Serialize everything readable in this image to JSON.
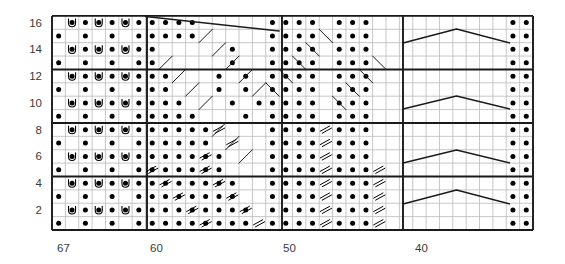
{
  "chart_data": {
    "type": "table",
    "title": "",
    "subtitle": "",
    "xlabel": "",
    "ylabel": "",
    "grid": true,
    "legend": "none",
    "rows": 16,
    "columns": 36,
    "row_labels": [
      "2",
      "4",
      "6",
      "8",
      "10",
      "12",
      "14",
      "16"
    ],
    "row_label_rows": [
      2,
      4,
      6,
      8,
      10,
      12,
      14,
      16
    ],
    "column_labels": [
      "67",
      "60",
      "50",
      "40"
    ],
    "column_label_positions": [
      0,
      7,
      17,
      27
    ],
    "column_label_x": [
      57,
      150,
      283,
      415
    ],
    "symbols": {
      "purl-dot": "•",
      "yarn-over-u": "U",
      "decrease-slant": "//",
      "cable-line": "line",
      "blank": ""
    },
    "geometry": {
      "grid_left": 52,
      "grid_top": 16,
      "grid_right": 533,
      "grid_bottom": 230,
      "cell_width": 13.36,
      "cell_height": 13.38,
      "heavy_vertical_x": [
        52,
        147,
        282,
        403,
        533
      ],
      "heavy_horizontal_rows": [
        0,
        4,
        8,
        12,
        16
      ]
    },
    "cells": {
      "dots": [
        [
          1,
          0
        ],
        [
          1,
          2
        ],
        [
          1,
          4
        ],
        [
          1,
          6
        ],
        [
          1,
          7
        ],
        [
          1,
          8
        ],
        [
          1,
          9
        ],
        [
          1,
          10
        ],
        [
          1,
          11
        ],
        [
          1,
          12
        ],
        [
          1,
          13
        ],
        [
          1,
          14
        ],
        [
          1,
          16
        ],
        [
          1,
          17
        ],
        [
          1,
          18
        ],
        [
          1,
          19
        ],
        [
          1,
          21
        ],
        [
          1,
          22
        ],
        [
          1,
          23
        ],
        [
          1,
          34
        ],
        [
          1,
          35
        ],
        [
          2,
          1
        ],
        [
          2,
          2
        ],
        [
          2,
          3
        ],
        [
          2,
          4
        ],
        [
          2,
          5
        ],
        [
          2,
          6
        ],
        [
          2,
          7
        ],
        [
          2,
          8
        ],
        [
          2,
          9
        ],
        [
          2,
          10
        ],
        [
          2,
          11
        ],
        [
          2,
          12
        ],
        [
          2,
          13
        ],
        [
          2,
          14
        ],
        [
          2,
          16
        ],
        [
          2,
          17
        ],
        [
          2,
          18
        ],
        [
          2,
          19
        ],
        [
          2,
          21
        ],
        [
          2,
          22
        ],
        [
          2,
          23
        ],
        [
          2,
          34
        ],
        [
          2,
          35
        ],
        [
          3,
          0
        ],
        [
          3,
          2
        ],
        [
          3,
          4
        ],
        [
          3,
          6
        ],
        [
          3,
          7
        ],
        [
          3,
          8
        ],
        [
          3,
          9
        ],
        [
          3,
          10
        ],
        [
          3,
          11
        ],
        [
          3,
          12
        ],
        [
          3,
          13
        ],
        [
          3,
          16
        ],
        [
          3,
          17
        ],
        [
          3,
          18
        ],
        [
          3,
          19
        ],
        [
          3,
          21
        ],
        [
          3,
          22
        ],
        [
          3,
          23
        ],
        [
          3,
          34
        ],
        [
          3,
          35
        ],
        [
          4,
          1
        ],
        [
          4,
          2
        ],
        [
          4,
          3
        ],
        [
          4,
          4
        ],
        [
          4,
          5
        ],
        [
          4,
          6
        ],
        [
          4,
          7
        ],
        [
          4,
          8
        ],
        [
          4,
          9
        ],
        [
          4,
          10
        ],
        [
          4,
          11
        ],
        [
          4,
          12
        ],
        [
          4,
          13
        ],
        [
          4,
          16
        ],
        [
          4,
          17
        ],
        [
          4,
          18
        ],
        [
          4,
          19
        ],
        [
          4,
          21
        ],
        [
          4,
          22
        ],
        [
          4,
          23
        ],
        [
          4,
          34
        ],
        [
          4,
          35
        ],
        [
          5,
          0
        ],
        [
          5,
          2
        ],
        [
          5,
          4
        ],
        [
          5,
          6
        ],
        [
          5,
          7
        ],
        [
          5,
          8
        ],
        [
          5,
          9
        ],
        [
          5,
          10
        ],
        [
          5,
          11
        ],
        [
          5,
          12
        ],
        [
          5,
          16
        ],
        [
          5,
          17
        ],
        [
          5,
          18
        ],
        [
          5,
          19
        ],
        [
          5,
          21
        ],
        [
          5,
          22
        ],
        [
          5,
          23
        ],
        [
          5,
          34
        ],
        [
          5,
          35
        ],
        [
          6,
          1
        ],
        [
          6,
          2
        ],
        [
          6,
          3
        ],
        [
          6,
          4
        ],
        [
          6,
          5
        ],
        [
          6,
          6
        ],
        [
          6,
          7
        ],
        [
          6,
          8
        ],
        [
          6,
          9
        ],
        [
          6,
          10
        ],
        [
          6,
          11
        ],
        [
          6,
          12
        ],
        [
          6,
          16
        ],
        [
          6,
          17
        ],
        [
          6,
          18
        ],
        [
          6,
          19
        ],
        [
          6,
          21
        ],
        [
          6,
          22
        ],
        [
          6,
          23
        ],
        [
          6,
          34
        ],
        [
          6,
          35
        ],
        [
          7,
          0
        ],
        [
          7,
          2
        ],
        [
          7,
          4
        ],
        [
          7,
          6
        ],
        [
          7,
          7
        ],
        [
          7,
          8
        ],
        [
          7,
          9
        ],
        [
          7,
          10
        ],
        [
          7,
          11
        ],
        [
          7,
          16
        ],
        [
          7,
          17
        ],
        [
          7,
          18
        ],
        [
          7,
          19
        ],
        [
          7,
          21
        ],
        [
          7,
          22
        ],
        [
          7,
          23
        ],
        [
          7,
          34
        ],
        [
          7,
          35
        ],
        [
          8,
          1
        ],
        [
          8,
          2
        ],
        [
          8,
          3
        ],
        [
          8,
          4
        ],
        [
          8,
          5
        ],
        [
          8,
          6
        ],
        [
          8,
          7
        ],
        [
          8,
          8
        ],
        [
          8,
          9
        ],
        [
          8,
          10
        ],
        [
          8,
          11
        ],
        [
          8,
          16
        ],
        [
          8,
          17
        ],
        [
          8,
          18
        ],
        [
          8,
          19
        ],
        [
          8,
          21
        ],
        [
          8,
          22
        ],
        [
          8,
          23
        ],
        [
          8,
          34
        ],
        [
          8,
          35
        ],
        [
          9,
          0
        ],
        [
          9,
          2
        ],
        [
          9,
          4
        ],
        [
          9,
          6
        ],
        [
          9,
          7
        ],
        [
          9,
          8
        ],
        [
          9,
          9
        ],
        [
          9,
          10
        ],
        [
          9,
          14
        ],
        [
          9,
          16
        ],
        [
          9,
          17
        ],
        [
          9,
          18
        ],
        [
          9,
          19
        ],
        [
          9,
          21
        ],
        [
          9,
          22
        ],
        [
          9,
          23
        ],
        [
          9,
          34
        ],
        [
          9,
          35
        ],
        [
          10,
          1
        ],
        [
          10,
          2
        ],
        [
          10,
          3
        ],
        [
          10,
          4
        ],
        [
          10,
          5
        ],
        [
          10,
          6
        ],
        [
          10,
          7
        ],
        [
          10,
          8
        ],
        [
          10,
          9
        ],
        [
          10,
          13
        ],
        [
          10,
          15
        ],
        [
          10,
          16
        ],
        [
          10,
          17
        ],
        [
          10,
          18
        ],
        [
          10,
          19
        ],
        [
          10,
          21
        ],
        [
          10,
          22
        ],
        [
          10,
          23
        ],
        [
          10,
          34
        ],
        [
          10,
          35
        ],
        [
          11,
          0
        ],
        [
          11,
          2
        ],
        [
          11,
          4
        ],
        [
          11,
          6
        ],
        [
          11,
          7
        ],
        [
          11,
          8
        ],
        [
          11,
          12
        ],
        [
          11,
          14
        ],
        [
          11,
          16
        ],
        [
          11,
          17
        ],
        [
          11,
          18
        ],
        [
          11,
          19
        ],
        [
          11,
          21
        ],
        [
          11,
          22
        ],
        [
          11,
          23
        ],
        [
          11,
          34
        ],
        [
          11,
          35
        ],
        [
          12,
          1
        ],
        [
          12,
          2
        ],
        [
          12,
          3
        ],
        [
          12,
          4
        ],
        [
          12,
          5
        ],
        [
          12,
          6
        ],
        [
          12,
          7
        ],
        [
          12,
          8
        ],
        [
          12,
          12
        ],
        [
          12,
          14
        ],
        [
          12,
          16
        ],
        [
          12,
          17
        ],
        [
          12,
          18
        ],
        [
          12,
          19
        ],
        [
          12,
          21
        ],
        [
          12,
          22
        ],
        [
          12,
          23
        ],
        [
          12,
          34
        ],
        [
          12,
          35
        ],
        [
          13,
          0
        ],
        [
          13,
          2
        ],
        [
          13,
          4
        ],
        [
          13,
          6
        ],
        [
          13,
          7
        ],
        [
          13,
          13
        ],
        [
          13,
          16
        ],
        [
          13,
          17
        ],
        [
          13,
          18
        ],
        [
          13,
          19
        ],
        [
          13,
          21
        ],
        [
          13,
          22
        ],
        [
          13,
          23
        ],
        [
          13,
          34
        ],
        [
          13,
          35
        ],
        [
          14,
          1
        ],
        [
          14,
          2
        ],
        [
          14,
          3
        ],
        [
          14,
          4
        ],
        [
          14,
          5
        ],
        [
          14,
          6
        ],
        [
          14,
          7
        ],
        [
          14,
          13
        ],
        [
          14,
          16
        ],
        [
          14,
          17
        ],
        [
          14,
          18
        ],
        [
          14,
          19
        ],
        [
          14,
          21
        ],
        [
          14,
          22
        ],
        [
          14,
          23
        ],
        [
          14,
          34
        ],
        [
          14,
          35
        ],
        [
          15,
          0
        ],
        [
          15,
          2
        ],
        [
          15,
          4
        ],
        [
          15,
          6
        ],
        [
          15,
          7
        ],
        [
          15,
          8
        ],
        [
          15,
          9
        ],
        [
          15,
          10
        ],
        [
          15,
          16
        ],
        [
          15,
          17
        ],
        [
          15,
          18
        ],
        [
          15,
          19
        ],
        [
          15,
          21
        ],
        [
          15,
          22
        ],
        [
          15,
          23
        ],
        [
          15,
          34
        ],
        [
          15,
          35
        ],
        [
          16,
          1
        ],
        [
          16,
          2
        ],
        [
          16,
          3
        ],
        [
          16,
          4
        ],
        [
          16,
          5
        ],
        [
          16,
          6
        ],
        [
          16,
          7
        ],
        [
          16,
          8
        ],
        [
          16,
          9
        ],
        [
          16,
          10
        ],
        [
          16,
          16
        ],
        [
          16,
          17
        ],
        [
          16,
          18
        ],
        [
          16,
          19
        ],
        [
          16,
          21
        ],
        [
          16,
          22
        ],
        [
          16,
          23
        ],
        [
          16,
          34
        ],
        [
          16,
          35
        ]
      ],
      "yarn_overs": [
        [
          2,
          1
        ],
        [
          2,
          3
        ],
        [
          2,
          5
        ],
        [
          4,
          1
        ],
        [
          4,
          3
        ],
        [
          4,
          5
        ],
        [
          6,
          1
        ],
        [
          6,
          3
        ],
        [
          6,
          5
        ],
        [
          8,
          1
        ],
        [
          8,
          3
        ],
        [
          8,
          5
        ],
        [
          10,
          1
        ],
        [
          10,
          3
        ],
        [
          10,
          5
        ],
        [
          12,
          1
        ],
        [
          12,
          3
        ],
        [
          12,
          5
        ],
        [
          14,
          1
        ],
        [
          14,
          3
        ],
        [
          14,
          5
        ],
        [
          16,
          1
        ],
        [
          16,
          3
        ],
        [
          16,
          5
        ]
      ],
      "decreases_right": [
        [
          1,
          11
        ],
        [
          1,
          15
        ],
        [
          2,
          10
        ],
        [
          2,
          14
        ],
        [
          3,
          9
        ],
        [
          3,
          13
        ],
        [
          4,
          8
        ],
        [
          4,
          12
        ],
        [
          5,
          7
        ],
        [
          5,
          11
        ],
        [
          6,
          11
        ],
        [
          7,
          13
        ],
        [
          8,
          12
        ]
      ],
      "decreases_left": [
        [
          1,
          20
        ],
        [
          1,
          24
        ],
        [
          2,
          20
        ],
        [
          2,
          24
        ],
        [
          3,
          20
        ],
        [
          3,
          24
        ],
        [
          4,
          20
        ],
        [
          4,
          24
        ],
        [
          5,
          20
        ],
        [
          5,
          24
        ],
        [
          6,
          20
        ],
        [
          7,
          20
        ],
        [
          8,
          20
        ]
      ]
    },
    "diagonals": [
      {
        "x1": 147,
        "y1": 29,
        "x2": 282,
        "y2": 43,
        "weight": "bold"
      },
      {
        "x1": 147,
        "y1": 163,
        "x2": 162,
        "y2": 150,
        "weight": "thin"
      },
      {
        "x1": 162,
        "y1": 150,
        "x2": 176,
        "y2": 136,
        "weight": "thin"
      }
    ],
    "diamonds": [
      {
        "left": 403,
        "right": 510,
        "top": 29,
        "bottom": 56,
        "mid_y": 43
      },
      {
        "left": 403,
        "right": 510,
        "top": 96,
        "bottom": 123,
        "mid_y": 109
      },
      {
        "left": 403,
        "right": 510,
        "top": 150,
        "bottom": 177,
        "mid_y": 163
      },
      {
        "left": 403,
        "right": 510,
        "top": 190,
        "bottom": 217,
        "mid_y": 204
      }
    ],
    "colors": {
      "grid_light": "#b9b9b9",
      "grid_heavy": "#1a1a1a",
      "symbol": "#000000",
      "label": "#3a3a3a",
      "background": "#ffffff"
    }
  }
}
